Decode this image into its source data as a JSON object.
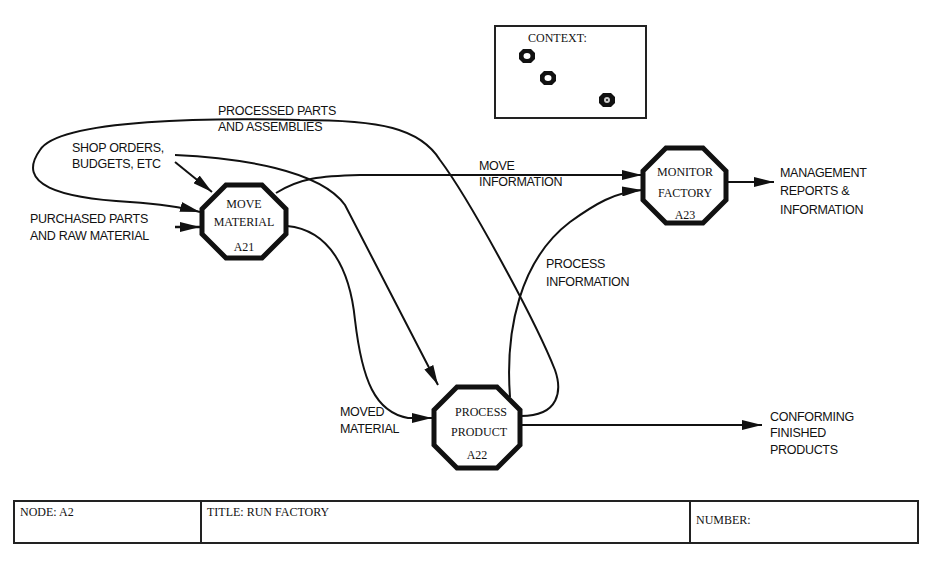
{
  "diagram": {
    "type": "IDEF0 decomposition",
    "context": {
      "label": "CONTEXT:",
      "markers": [
        {
          "id": "ctx-1",
          "filled": false
        },
        {
          "id": "ctx-2",
          "filled": false
        },
        {
          "id": "ctx-3",
          "filled": true
        }
      ]
    },
    "activities": [
      {
        "id": "A21",
        "line1": "MOVE",
        "line2": "MATERIAL",
        "code": "A21"
      },
      {
        "id": "A22",
        "line1": "PROCESS",
        "line2": "PRODUCT",
        "code": "A22"
      },
      {
        "id": "A23",
        "line1": "MONITOR",
        "line2": "FACTORY",
        "code": "A23"
      }
    ],
    "arrows": [
      {
        "id": "processed-parts",
        "line1": "PROCESSED PARTS",
        "line2": "AND ASSEMBLIES",
        "from": "A22",
        "to": "A21"
      },
      {
        "id": "shop-orders",
        "line1": "SHOP ORDERS,",
        "line2": "BUDGETS, ETC",
        "from": "external",
        "to": "A21,A22"
      },
      {
        "id": "purchased-parts",
        "line1": "PURCHASED PARTS",
        "line2": "AND RAW MATERIAL",
        "from": "external",
        "to": "A21"
      },
      {
        "id": "move-information",
        "line1": "MOVE",
        "line2": "INFORMATION",
        "from": "A21",
        "to": "A23"
      },
      {
        "id": "process-information",
        "line1": "PROCESS",
        "line2": "INFORMATION",
        "from": "A22",
        "to": "A23"
      },
      {
        "id": "moved-material",
        "line1": "MOVED",
        "line2": "MATERIAL",
        "from": "A21",
        "to": "A22"
      },
      {
        "id": "management-reports",
        "line1": "MANAGEMENT",
        "line2": "REPORTS &",
        "line3": "INFORMATION",
        "from": "A23",
        "to": "external"
      },
      {
        "id": "conforming-products",
        "line1": "CONFORMING",
        "line2": "FINISHED",
        "line3": "PRODUCTS",
        "from": "A22",
        "to": "external"
      }
    ]
  },
  "footer": {
    "node": "NODE:  A2",
    "title": "TITLE:  RUN FACTORY",
    "number": "NUMBER:"
  }
}
